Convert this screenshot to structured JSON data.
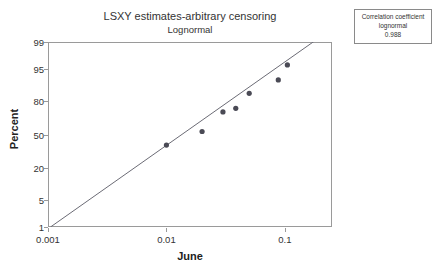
{
  "chart_data": {
    "type": "scatter",
    "title": "LSXY estimates-arbitrary censoring",
    "subtitle": "Lognormal",
    "xlabel": "June",
    "ylabel": "Percent",
    "xscale": "log",
    "yscale": "probit",
    "xlim": [
      0.001,
      0.25
    ],
    "ylim": [
      1,
      99
    ],
    "grid": false,
    "legend": null,
    "xticks": [
      {
        "value": 0.001,
        "label": "0.001"
      },
      {
        "value": 0.01,
        "label": "0.01"
      },
      {
        "value": 0.1,
        "label": "0.1"
      }
    ],
    "yticks": [
      {
        "value": 99,
        "label": "99"
      },
      {
        "value": 95,
        "label": "95"
      },
      {
        "value": 80,
        "label": "80"
      },
      {
        "value": 50,
        "label": "50"
      },
      {
        "value": 20,
        "label": "20"
      },
      {
        "value": 5,
        "label": "5"
      },
      {
        "value": 1,
        "label": "1"
      }
    ],
    "points": [
      {
        "x": 0.01,
        "y": 39.5
      },
      {
        "x": 0.02,
        "y": 53.0
      },
      {
        "x": 0.03,
        "y": 71.5
      },
      {
        "x": 0.0385,
        "y": 74.5
      },
      {
        "x": 0.05,
        "y": 85.0
      },
      {
        "x": 0.088,
        "y": 91.5
      },
      {
        "x": 0.105,
        "y": 96.0
      }
    ],
    "fit_line": {
      "x_start": 0.00105,
      "y_start": 1.0,
      "x_end": 0.2,
      "y_end": 99.3
    },
    "point_color": "#4a4a55",
    "line_color": "#6b6b75",
    "frame_color": "#9a9a9a"
  },
  "annotation_box": {
    "line1": "Correlation coefficient",
    "line2": "lognormal",
    "line3": "0.988"
  }
}
